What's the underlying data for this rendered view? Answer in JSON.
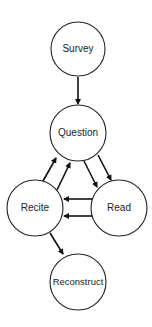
{
  "diagram": {
    "type": "flowchart",
    "nodes": [
      {
        "id": "survey",
        "label": "Survey"
      },
      {
        "id": "question",
        "label": "Question"
      },
      {
        "id": "recite",
        "label": "Recite"
      },
      {
        "id": "read",
        "label": "Read"
      },
      {
        "id": "reconstruct",
        "label": "Reconstruct"
      }
    ],
    "edges": [
      {
        "from": "survey",
        "to": "question"
      },
      {
        "from": "recite",
        "to": "question",
        "count": 2
      },
      {
        "from": "question",
        "to": "read",
        "count": 2
      },
      {
        "from": "read",
        "to": "recite",
        "count": 2
      },
      {
        "from": "recite",
        "to": "reconstruct"
      }
    ]
  }
}
